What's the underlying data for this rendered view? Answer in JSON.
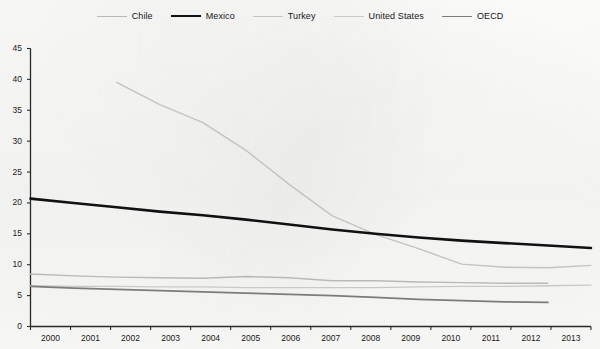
{
  "legend": {
    "position": "top-center",
    "items": [
      {
        "label": "Chile",
        "color": "#b9b9b9",
        "width": 1.2
      },
      {
        "label": "Mexico",
        "color": "#111111",
        "width": 2.6
      },
      {
        "label": "Turkey",
        "color": "#c3c3c3",
        "width": 1.2
      },
      {
        "label": "United States",
        "color": "#c9c9c9",
        "width": 1.2
      },
      {
        "label": "OECD",
        "color": "#7c7c7c",
        "width": 1.6
      }
    ]
  },
  "axes": {
    "y_ticks": [
      "0",
      "5",
      "10",
      "15",
      "20",
      "25",
      "30",
      "35",
      "40",
      "45"
    ],
    "x_ticks": [
      "2000",
      "2001",
      "2002",
      "2003",
      "2004",
      "2005",
      "2006",
      "2007",
      "2008",
      "2009",
      "2010",
      "2011",
      "2012",
      "2013"
    ]
  },
  "chart_data": {
    "type": "line",
    "title": "",
    "xlabel": "",
    "ylabel": "",
    "x": [
      2000,
      2001,
      2002,
      2003,
      2004,
      2005,
      2006,
      2007,
      2008,
      2009,
      2010,
      2011,
      2012,
      2013
    ],
    "xlim": [
      2000,
      2013
    ],
    "ylim": [
      0,
      45
    ],
    "ytick_step": 5,
    "grid": false,
    "legend_position": "top-center",
    "series": [
      {
        "name": "Mexico",
        "color": "#111111",
        "width": 2.6,
        "x": [
          2000,
          2001,
          2002,
          2003,
          2004,
          2005,
          2006,
          2007,
          2008,
          2009,
          2010,
          2011,
          2012,
          2013
        ],
        "values": [
          20.7,
          20.0,
          19.3,
          18.6,
          18.0,
          17.3,
          16.5,
          15.7,
          15.0,
          14.4,
          13.9,
          13.5,
          13.1,
          12.7
        ]
      },
      {
        "name": "Turkey",
        "color": "#c3c3c3",
        "width": 1.4,
        "x": [
          2002,
          2003,
          2004,
          2005,
          2006,
          2007,
          2008,
          2009,
          2010,
          2011,
          2012,
          2013
        ],
        "values": [
          39.5,
          35.9,
          33.0,
          28.5,
          23.0,
          17.9,
          14.9,
          12.6,
          10.1,
          9.6,
          9.5,
          9.9
        ]
      },
      {
        "name": "Chile",
        "color": "#b9b9b9",
        "width": 1.4,
        "x": [
          2000,
          2001,
          2002,
          2003,
          2004,
          2005,
          2006,
          2007,
          2008,
          2009,
          2010,
          2011,
          2012
        ],
        "values": [
          8.5,
          8.2,
          8.0,
          7.9,
          7.8,
          8.1,
          7.9,
          7.4,
          7.4,
          7.2,
          7.1,
          7.0,
          7.0
        ]
      },
      {
        "name": "United States",
        "color": "#c9c9c9",
        "width": 1.3,
        "x": [
          2000,
          2001,
          2002,
          2003,
          2004,
          2005,
          2006,
          2007,
          2008,
          2009,
          2010,
          2011,
          2012,
          2013
        ],
        "values": [
          6.6,
          6.5,
          6.5,
          6.4,
          6.4,
          6.3,
          6.3,
          6.3,
          6.3,
          6.4,
          6.5,
          6.5,
          6.6,
          6.7
        ]
      },
      {
        "name": "OECD",
        "color": "#7c7c7c",
        "width": 1.7,
        "x": [
          2000,
          2001,
          2002,
          2003,
          2004,
          2005,
          2006,
          2007,
          2008,
          2009,
          2010,
          2011,
          2012
        ],
        "values": [
          6.5,
          6.2,
          6.0,
          5.8,
          5.6,
          5.4,
          5.2,
          5.0,
          4.7,
          4.4,
          4.2,
          4.0,
          3.9
        ]
      }
    ]
  }
}
